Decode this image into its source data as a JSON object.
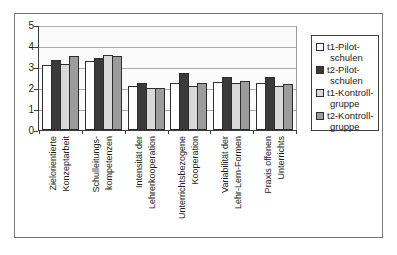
{
  "figure": {
    "background": "#ffffff",
    "frame_border_color": "#767676",
    "axis_color": "#3c3c3c",
    "gridline_color": "#acacac",
    "bar_border_color": "#2d2d2d",
    "text_color": "#1c1c1c"
  },
  "chart_data": {
    "type": "bar",
    "title": "",
    "xlabel": "",
    "ylabel": "",
    "ylim": [
      0,
      5
    ],
    "ytick_step": 1,
    "yticks": [
      "0",
      "1",
      "2",
      "3",
      "4",
      "5"
    ],
    "grid": true,
    "legend_position": "right",
    "categories": [
      "Zielorientierte Konzeptarbeit",
      "Schulleitungs-kompetenzen",
      "Intensität der Lehrerkooperation",
      "Unterrichtsbezogene Kooperation",
      "Variabilität der Lehr-Lern-Formen",
      "Praxis offenen Unterrichts"
    ],
    "categories_lines": [
      [
        "Zielorientierte",
        "Konzeptarbeit"
      ],
      [
        "Schulleitungs-",
        "kompetenzen"
      ],
      [
        "Intensität der",
        "Lehrerkooperation"
      ],
      [
        "Unterrichtsbezogene",
        "Kooperation"
      ],
      [
        "Variabilität der",
        "Lehr-Lern-Formen"
      ],
      [
        "Praxis offenen",
        "Unterrichts"
      ]
    ],
    "series": [
      {
        "name": "t1-Pilot-schulen",
        "label_lines": [
          "t1-Pilot-",
          "schulen"
        ],
        "color": "#ffffff",
        "values": [
          3.1,
          3.3,
          2.1,
          2.25,
          2.3,
          2.25
        ]
      },
      {
        "name": "t2-Pilot-schulen",
        "label_lines": [
          "t2-Pilot-",
          "schulen"
        ],
        "color": "#3a3a3a",
        "values": [
          3.35,
          3.45,
          2.25,
          2.7,
          2.5,
          2.5
        ]
      },
      {
        "name": "t1-Kontroll-gruppe",
        "label_lines": [
          "t1-Kontroll-",
          "gruppe"
        ],
        "color": "#d8d8d8",
        "values": [
          3.15,
          3.55,
          2.0,
          2.1,
          2.25,
          2.1
        ]
      },
      {
        "name": "t2-Kontroll-gruppe",
        "label_lines": [
          "t2-Kontroll-",
          "gruppe"
        ],
        "color": "#9c9c9c",
        "values": [
          3.5,
          3.5,
          2.0,
          2.25,
          2.35,
          2.2
        ]
      }
    ]
  }
}
